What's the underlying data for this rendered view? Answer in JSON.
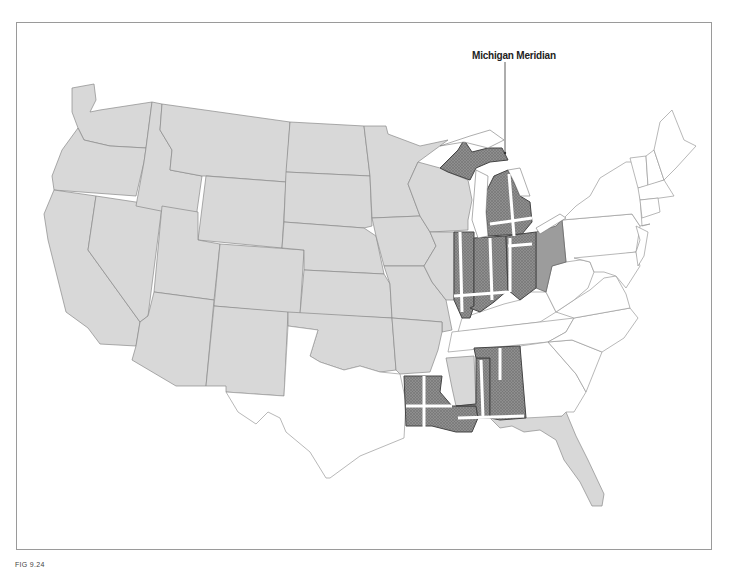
{
  "figure": {
    "label": "FIG 9.24",
    "type": "thematic map",
    "callout": {
      "text": "Michigan Meridian",
      "target": "Michigan"
    }
  },
  "legend_colors": {
    "light_gray_states": "#d8d8d8",
    "dark_hatched_states": "#8c8c8c",
    "white_states": "#ffffff",
    "meridian_lines": "#ffffff",
    "frame_border": "#9a9a9a"
  },
  "regions": {
    "light_gray": [
      "Washington",
      "Oregon",
      "California",
      "Nevada",
      "Idaho",
      "Montana",
      "Wyoming",
      "Utah",
      "Arizona",
      "Colorado",
      "New Mexico",
      "North Dakota",
      "South Dakota",
      "Nebraska",
      "Kansas",
      "Oklahoma",
      "Minnesota",
      "Iowa",
      "Missouri",
      "Arkansas",
      "Wisconsin",
      "Illinois (west)",
      "Mississippi (north)",
      "Florida"
    ],
    "dark_hatched": [
      "Michigan",
      "Indiana",
      "Illinois (east)",
      "Ohio (west)",
      "Louisiana",
      "Mississippi (south)",
      "Alabama"
    ],
    "medium_gray": [
      "Ohio (east)"
    ],
    "white": [
      "Texas",
      "Kentucky",
      "Tennessee",
      "Georgia",
      "South Carolina",
      "North Carolina",
      "Virginia",
      "West Virginia",
      "Pennsylvania",
      "New York",
      "New Jersey",
      "Delaware",
      "Maryland",
      "Connecticut",
      "Rhode Island",
      "Massachusetts",
      "Vermont",
      "New Hampshire",
      "Maine"
    ]
  }
}
